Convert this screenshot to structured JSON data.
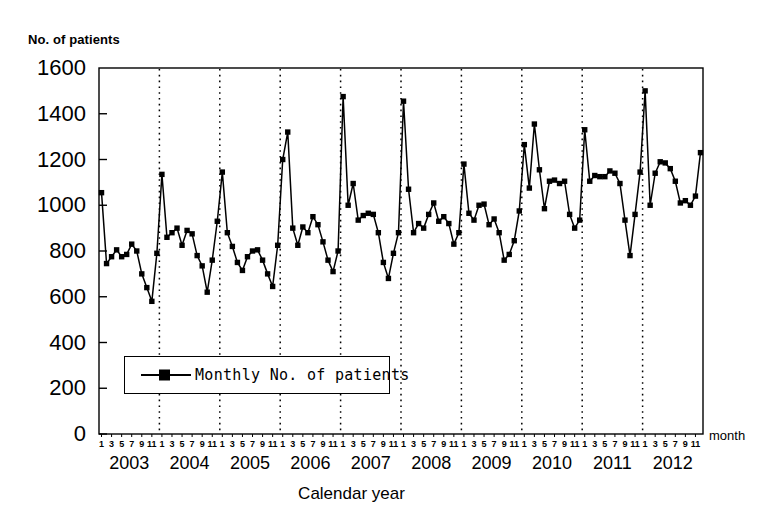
{
  "chart_data": {
    "type": "line",
    "title": "",
    "ylabel": "No. of patients",
    "xlabel": "Calendar year",
    "x_unit_label": "month",
    "ylim": [
      0,
      1600
    ],
    "yticks": [
      0,
      200,
      400,
      600,
      800,
      1000,
      1200,
      1400,
      1600
    ],
    "ytick_labels": [
      "0",
      "200",
      "400",
      "600",
      "800",
      "1000",
      "1200",
      "1400",
      "1600"
    ],
    "grid": "vertical-dotted-at-year-boundaries",
    "legend_position": "inside-lower-left",
    "month_tick_labels": [
      "1",
      "3",
      "5",
      "7",
      "9",
      "11"
    ],
    "years": [
      "2003",
      "2004",
      "2005",
      "2006",
      "2007",
      "2008",
      "2009",
      "2010",
      "2011",
      "2012"
    ],
    "series": [
      {
        "name": "Monthly No. of patients",
        "marker": "filled-square",
        "color": "#000000",
        "x": [
          "2003-1",
          "2003-2",
          "2003-3",
          "2003-4",
          "2003-5",
          "2003-6",
          "2003-7",
          "2003-8",
          "2003-9",
          "2003-10",
          "2003-11",
          "2003-12",
          "2004-1",
          "2004-2",
          "2004-3",
          "2004-4",
          "2004-5",
          "2004-6",
          "2004-7",
          "2004-8",
          "2004-9",
          "2004-10",
          "2004-11",
          "2004-12",
          "2005-1",
          "2005-2",
          "2005-3",
          "2005-4",
          "2005-5",
          "2005-6",
          "2005-7",
          "2005-8",
          "2005-9",
          "2005-10",
          "2005-11",
          "2005-12",
          "2006-1",
          "2006-2",
          "2006-3",
          "2006-4",
          "2006-5",
          "2006-6",
          "2006-7",
          "2006-8",
          "2006-9",
          "2006-10",
          "2006-11",
          "2006-12",
          "2007-1",
          "2007-2",
          "2007-3",
          "2007-4",
          "2007-5",
          "2007-6",
          "2007-7",
          "2007-8",
          "2007-9",
          "2007-10",
          "2007-11",
          "2007-12",
          "2008-1",
          "2008-2",
          "2008-3",
          "2008-4",
          "2008-5",
          "2008-6",
          "2008-7",
          "2008-8",
          "2008-9",
          "2008-10",
          "2008-11",
          "2008-12",
          "2009-1",
          "2009-2",
          "2009-3",
          "2009-4",
          "2009-5",
          "2009-6",
          "2009-7",
          "2009-8",
          "2009-9",
          "2009-10",
          "2009-11",
          "2009-12",
          "2010-1",
          "2010-2",
          "2010-3",
          "2010-4",
          "2010-5",
          "2010-6",
          "2010-7",
          "2010-8",
          "2010-9",
          "2010-10",
          "2010-11",
          "2010-12",
          "2011-1",
          "2011-2",
          "2011-3",
          "2011-4",
          "2011-5",
          "2011-6",
          "2011-7",
          "2011-8",
          "2011-9",
          "2011-10",
          "2011-11",
          "2011-12",
          "2012-1",
          "2012-2",
          "2012-3",
          "2012-4",
          "2012-5",
          "2012-6",
          "2012-7",
          "2012-8",
          "2012-9",
          "2012-10",
          "2012-11",
          "2012-12"
        ],
        "values": [
          1055,
          745,
          775,
          805,
          775,
          785,
          830,
          800,
          700,
          640,
          580,
          790,
          1135,
          860,
          880,
          900,
          825,
          890,
          875,
          780,
          735,
          620,
          760,
          930,
          1145,
          880,
          820,
          750,
          715,
          775,
          800,
          805,
          760,
          700,
          645,
          825,
          1200,
          1320,
          900,
          825,
          905,
          880,
          950,
          915,
          840,
          760,
          710,
          800,
          1475,
          1000,
          1095,
          935,
          955,
          965,
          960,
          880,
          750,
          680,
          790,
          880,
          1455,
          1070,
          880,
          920,
          900,
          960,
          1010,
          930,
          950,
          920,
          830,
          880,
          1180,
          965,
          935,
          1000,
          1005,
          915,
          940,
          880,
          760,
          785,
          845,
          975,
          1265,
          1075,
          1355,
          1155,
          985,
          1105,
          1110,
          1095,
          1105,
          960,
          900,
          935,
          1330,
          1105,
          1130,
          1125,
          1125,
          1150,
          1140,
          1095,
          935,
          780,
          960,
          1145,
          1500,
          1000,
          1140,
          1190,
          1185,
          1160,
          1105,
          1010,
          1020,
          1000,
          1040,
          1230
        ]
      }
    ]
  },
  "legend": {
    "entries": [
      {
        "label": "Monthly No. of patients",
        "marker": "line-with-square-marker"
      }
    ]
  }
}
